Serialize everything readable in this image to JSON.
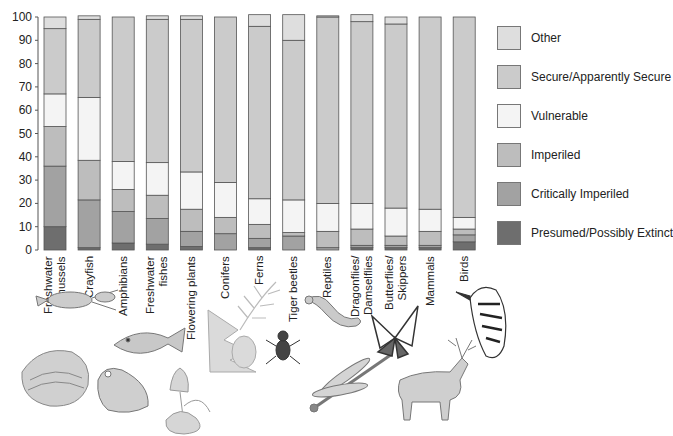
{
  "chart_data": {
    "type": "bar",
    "stacked": true,
    "title": "",
    "xlabel": "",
    "ylabel": "",
    "ylim": [
      0,
      100
    ],
    "yticks": [
      0,
      10,
      20,
      30,
      40,
      50,
      60,
      70,
      80,
      90,
      100
    ],
    "grid": false,
    "legend_position": "right",
    "categories": [
      "Freshwater\nmussels",
      "Crayfish",
      "Amphibians",
      "Freshwater\nfishes",
      "Flowering plants",
      "Conifers",
      "Ferns",
      "Tiger beetles",
      "Reptiles",
      "Dragonflies/\nDamselflies",
      "Butterflies/\nSkippers",
      "Mammals",
      "Birds"
    ],
    "series": [
      {
        "name": "Presumed/Possibly Extinct",
        "color": "#6e6e6e",
        "values": [
          10,
          1,
          3,
          2.5,
          1.5,
          0,
          1,
          0,
          0,
          1,
          1,
          1,
          3.5
        ]
      },
      {
        "name": "Critically Imperiled",
        "color": "#a2a2a2",
        "values": [
          26,
          20.5,
          13.5,
          11,
          6.5,
          7,
          4,
          6,
          1,
          1,
          1,
          1,
          3
        ]
      },
      {
        "name": "Imperiled",
        "color": "#bdbdbd",
        "values": [
          17,
          17,
          9.5,
          10,
          9.5,
          7,
          6,
          1.5,
          7,
          7,
          4,
          6,
          2.5
        ]
      },
      {
        "name": "Vulnerable",
        "color": "#f4f4f4",
        "values": [
          14,
          27,
          12,
          14,
          16,
          15,
          11,
          14,
          12,
          11,
          12,
          9.5,
          5
        ]
      },
      {
        "name": "Secure/Apparently Secure",
        "color": "#cbcbcb",
        "values": [
          28,
          33.5,
          62,
          61.5,
          65.5,
          71,
          74,
          68.5,
          80,
          78,
          79,
          82.5,
          86
        ]
      },
      {
        "name": "Other",
        "color": "#dedede",
        "values": [
          5,
          1.5,
          0,
          1.5,
          1.5,
          0,
          5,
          11,
          0.5,
          3,
          3,
          0,
          0
        ]
      }
    ]
  },
  "legend": {
    "items": [
      {
        "label": "Other",
        "color": "#dedede"
      },
      {
        "label": "Secure/Apparently Secure",
        "color": "#cbcbcb"
      },
      {
        "label": "Vulnerable",
        "color": "#f4f4f4"
      },
      {
        "label": "Imperiled",
        "color": "#bdbdbd"
      },
      {
        "label": "Critically Imperiled",
        "color": "#a2a2a2"
      },
      {
        "label": "Presumed/Possibly Extinct",
        "color": "#6e6e6e"
      }
    ]
  },
  "illustrations": [
    "mussel",
    "crayfish",
    "fish",
    "frog",
    "flowering-plant",
    "conifer",
    "fern",
    "tiger-beetle",
    "lizard",
    "dragonfly",
    "butterfly",
    "deer",
    "woodpecker"
  ]
}
